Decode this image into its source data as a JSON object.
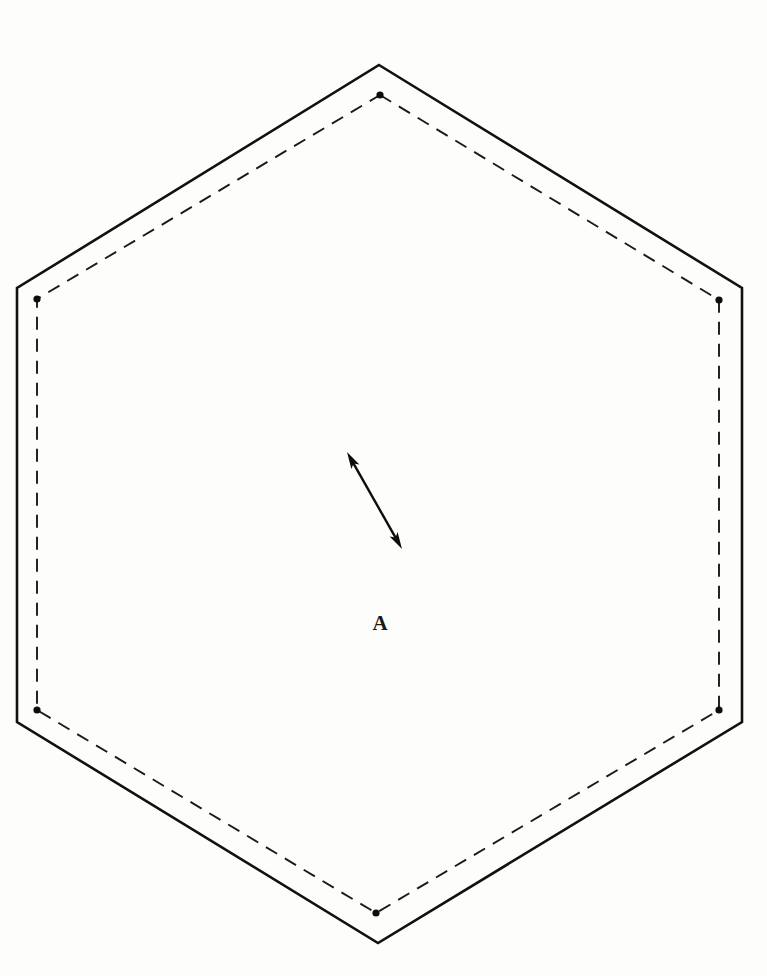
{
  "figure": {
    "background_color": "#fdfdfb",
    "width": 767,
    "height": 976
  },
  "labels": {
    "region_a": "A"
  },
  "chart_data": {
    "type": "diagram",
    "xlabel": "",
    "ylabel": "",
    "xlim": [
      0,
      767
    ],
    "ylim": [
      976,
      0
    ],
    "grid": false,
    "legend": null,
    "series": [
      {
        "name": "outer-hexagon",
        "style": "solid",
        "color": "#111111",
        "line_width": 2.6,
        "closed": true,
        "points": [
          [
            379,
            65
          ],
          [
            742,
            288
          ],
          [
            742,
            722
          ],
          [
            378,
            943
          ],
          [
            17,
            722
          ],
          [
            17,
            288
          ]
        ]
      },
      {
        "name": "inner-hexagon",
        "style": "dashed",
        "color": "#1a1a1a",
        "line_width": 1.9,
        "dash_pattern": [
          13,
          9
        ],
        "closed": true,
        "points": [
          [
            380,
            95
          ],
          [
            719,
            300
          ],
          [
            719,
            710
          ],
          [
            376,
            913
          ],
          [
            37,
            710
          ],
          [
            37,
            299
          ]
        ]
      },
      {
        "name": "inner-hexagon-vertex-markers",
        "style": "points",
        "color": "#0d0d0d",
        "marker": "filled-circle",
        "marker_radius": 3.6,
        "points": [
          [
            380,
            95
          ],
          [
            719,
            300
          ],
          [
            719,
            710
          ],
          [
            376,
            913
          ],
          [
            37,
            710
          ],
          [
            37,
            299
          ]
        ]
      },
      {
        "name": "double-headed-arrow",
        "style": "arrow",
        "color": "#0d0d0d",
        "line_width": 2.4,
        "arrowheads": "both",
        "points": [
          [
            347,
            452
          ],
          [
            402,
            549
          ]
        ]
      }
    ],
    "annotations": [
      {
        "text": "A",
        "x": 380,
        "y": 630,
        "font_style": "serif-bold",
        "font_size": 21
      }
    ]
  }
}
